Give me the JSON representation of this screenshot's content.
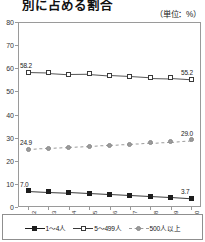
{
  "chart_data": {
    "type": "line",
    "title": "別に占める割合",
    "subtitle": "",
    "unit_note": "（単位：%）",
    "xlabel": "",
    "ylabel": "",
    "ylim": [
      0,
      80
    ],
    "ytick_values": [
      0,
      10,
      20,
      30,
      40,
      50,
      60,
      70,
      80
    ],
    "ytick_labels": [
      "0",
      "10",
      "20",
      "30",
      "40",
      "50",
      "60",
      "70",
      "80"
    ],
    "grid": false,
    "legend_position": "bottom",
    "categories": [
      "2012",
      "2013",
      "2014",
      "2015",
      "2016",
      "2017",
      "2018",
      "2019",
      "2020"
    ],
    "series": [
      {
        "name": "1～4人",
        "marker": "filled-square-black",
        "line": "solid",
        "color": "#1d1d1d",
        "values": [
          7.0,
          6.6,
          6.3,
          5.9,
          5.5,
          5.1,
          4.7,
          4.3,
          3.7
        ],
        "labels": {
          "first": "7.0",
          "last": "3.7"
        }
      },
      {
        "name": "5～499人",
        "marker": "open-square",
        "line": "solid",
        "color": "#3a3a3a",
        "values": [
          58.2,
          58.0,
          57.5,
          57.6,
          56.9,
          56.5,
          56.0,
          55.8,
          55.2
        ],
        "labels": {
          "first": "58.2",
          "last": "55.2"
        }
      },
      {
        "name": "500人以上",
        "marker": "gray-square",
        "line": "dashed",
        "color": "#9b9b9b",
        "values": [
          24.9,
          25.4,
          25.8,
          26.2,
          26.7,
          27.2,
          27.8,
          28.3,
          29.0
        ],
        "labels": {
          "first": "24.9",
          "last": "29.0"
        }
      }
    ]
  },
  "legend": {
    "items": [
      {
        "label": "1～4人",
        "symbol": "filled-square-black"
      },
      {
        "label": "5～499人",
        "symbol": "open-square"
      },
      {
        "label": "500人以上",
        "symbol": "gray-square"
      }
    ]
  }
}
